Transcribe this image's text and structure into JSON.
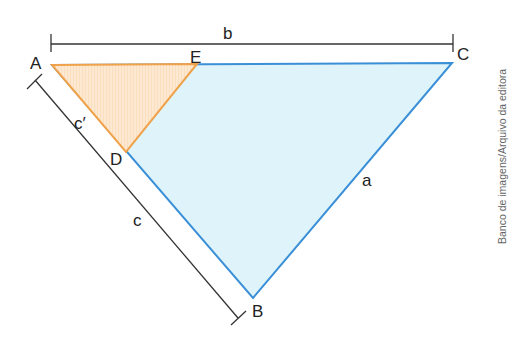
{
  "figure": {
    "vertices": {
      "A": {
        "label": "A"
      },
      "B": {
        "label": "B"
      },
      "C": {
        "label": "C"
      },
      "D": {
        "label": "D"
      },
      "E": {
        "label": "E"
      }
    },
    "sides": {
      "a": "a",
      "b": "b",
      "c": "c",
      "c_prime": "c′"
    },
    "colors": {
      "large_triangle_fill": "#def4fa",
      "large_triangle_stroke": "#3a8fd6",
      "small_triangle_fill": "#fde7cc",
      "small_triangle_stroke": "#f0a24a",
      "bracket_stroke": "#333333"
    },
    "credit": "Banco de imagens/Arquivo da editora"
  }
}
